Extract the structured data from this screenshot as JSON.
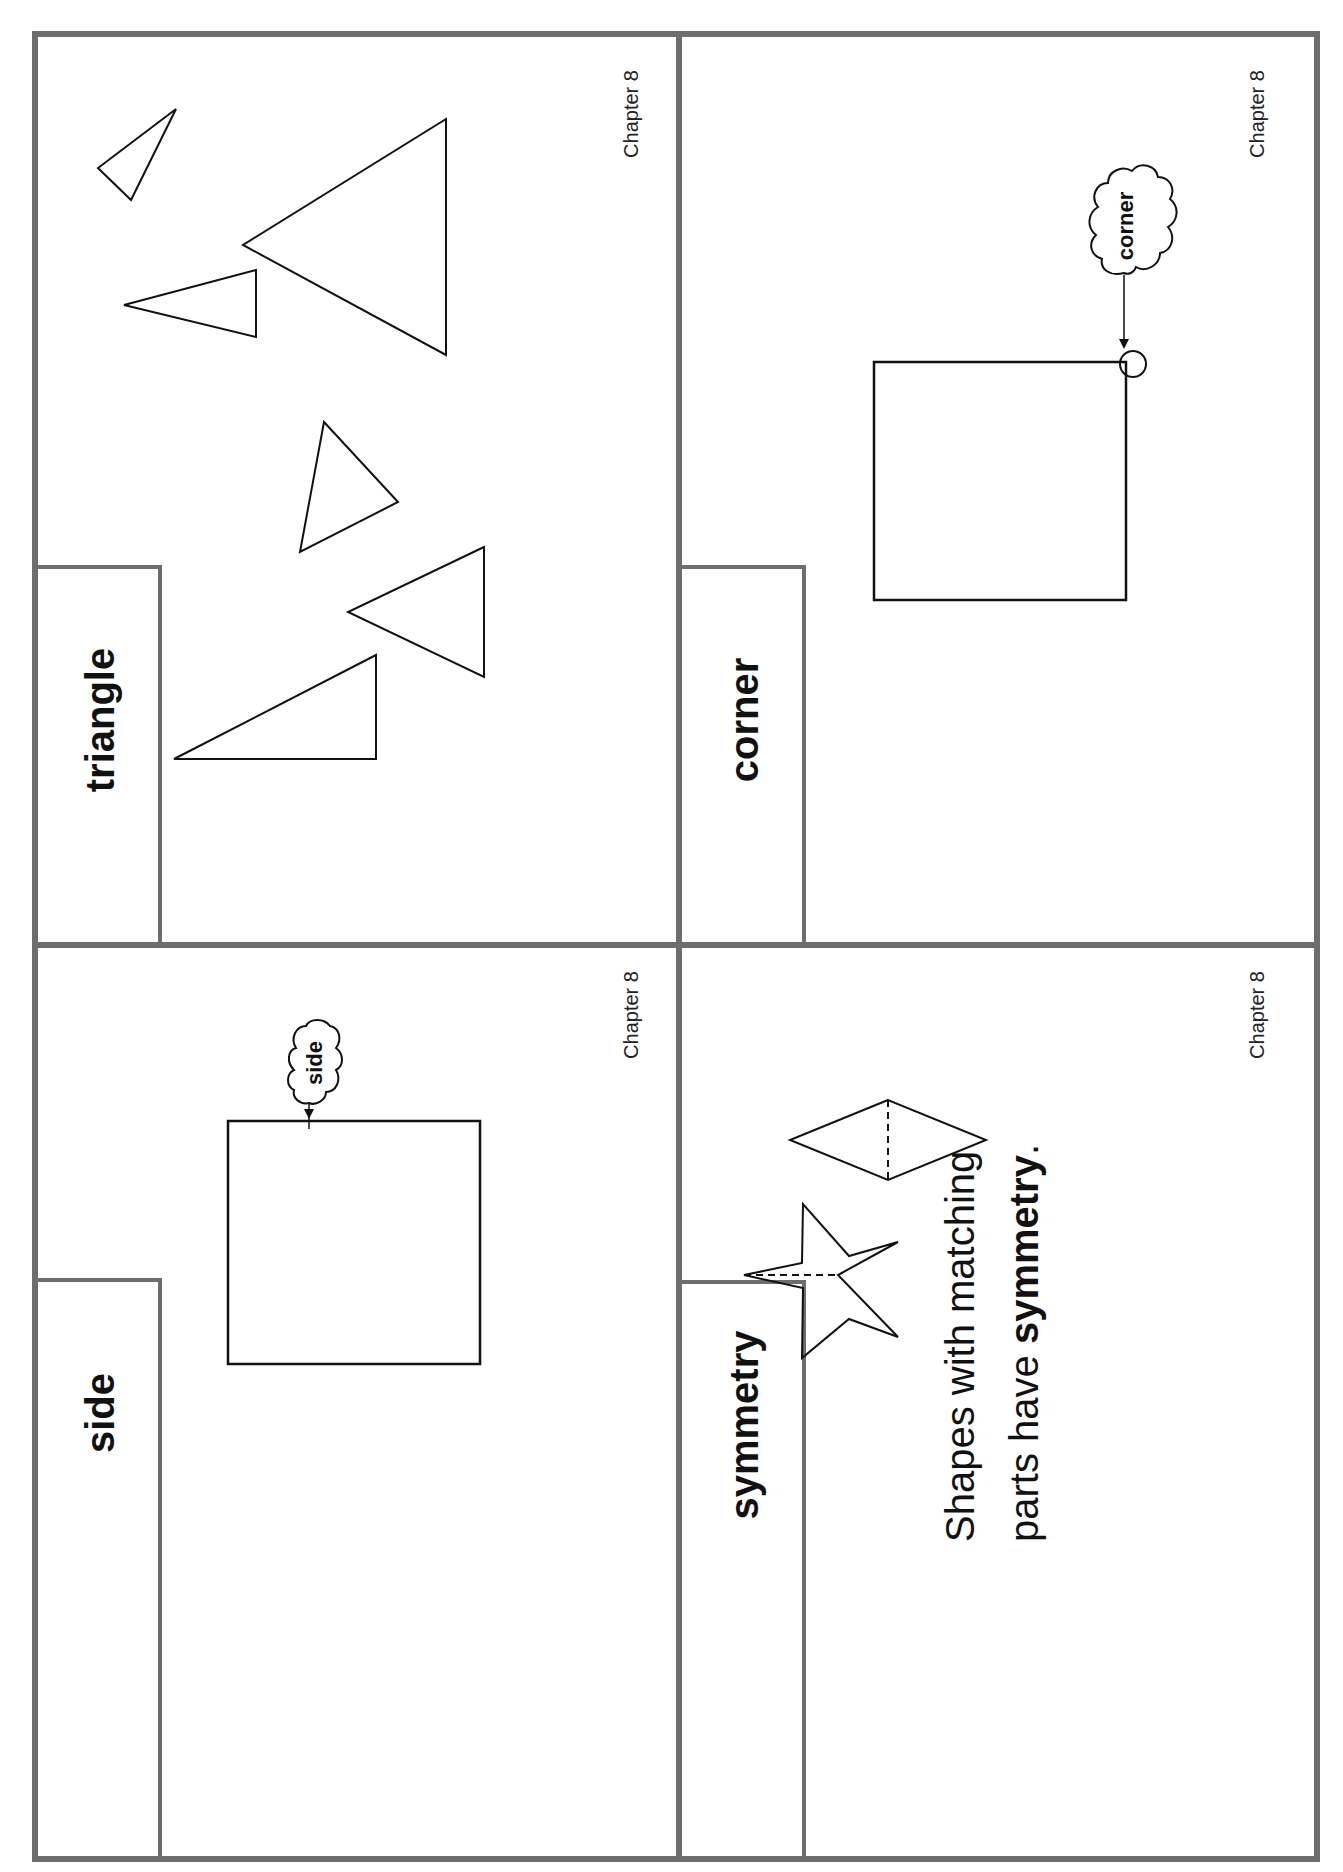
{
  "cards": [
    {
      "id": "triangle",
      "word": "triangle",
      "chapter": "Chapter 8",
      "illustration": "six outlined triangles of various sizes and orientations"
    },
    {
      "id": "corner",
      "word": "corner",
      "chapter": "Chapter 8",
      "callout": "corner",
      "illustration": "square with circled corner and cloud callout"
    },
    {
      "id": "side",
      "word": "side",
      "chapter": "Chapter 8",
      "callout": "side",
      "illustration": "square with arrow pointing to a side and cloud callout"
    },
    {
      "id": "symmetry",
      "word": "symmetry",
      "chapter": "Chapter 8",
      "sentence_line1": "Shapes with matching",
      "sentence_line2_prefix": "parts have ",
      "sentence_line2_bold": "symmetry",
      "sentence_line2_suffix": ".",
      "illustration": "star and rhombus with dashed lines of symmetry"
    }
  ],
  "colors": {
    "frame": "#6d6d6d",
    "ink": "#111111"
  }
}
